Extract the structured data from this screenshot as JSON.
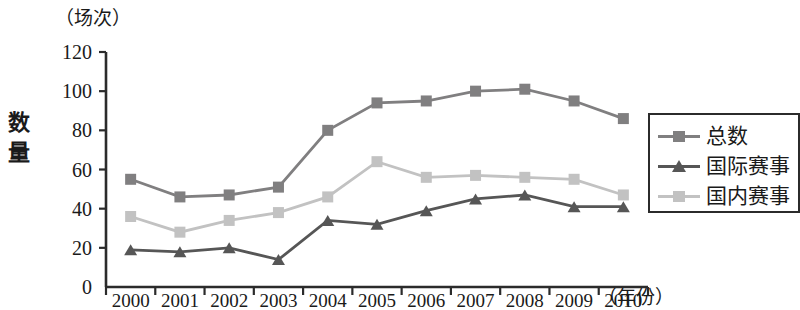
{
  "chart_data": {
    "type": "line",
    "title": "",
    "unit_label": "（场次）",
    "ylabel": "数量",
    "xlabel": "（年份）",
    "categories": [
      "2000",
      "2001",
      "2002",
      "2003",
      "2004",
      "2005",
      "2006",
      "2007",
      "2008",
      "2009",
      "2010"
    ],
    "ylim": [
      0,
      120
    ],
    "yticks": [
      0,
      20,
      40,
      60,
      80,
      100,
      120
    ],
    "ytick_labels": [
      "0",
      "20",
      "40",
      "60",
      "80",
      "100",
      "120"
    ],
    "grid": false,
    "legend_position": "right",
    "series": [
      {
        "name": "总数",
        "color": "#807f80",
        "marker": "square",
        "values": [
          55,
          46,
          47,
          51,
          80,
          94,
          95,
          100,
          101,
          95,
          86
        ]
      },
      {
        "name": "国际赛事",
        "color": "#565656",
        "marker": "triangle",
        "values": [
          19,
          18,
          20,
          14,
          34,
          32,
          39,
          45,
          47,
          41,
          41
        ]
      },
      {
        "name": "国内赛事",
        "color": "#c2c2c2",
        "marker": "square",
        "values": [
          36,
          28,
          34,
          38,
          46,
          64,
          56,
          57,
          56,
          55,
          47
        ]
      }
    ]
  },
  "axis": {
    "y_title_chars": [
      "数",
      "量"
    ],
    "unit": "（场次）",
    "x_unit": "（年份）"
  },
  "legend": {
    "items": [
      {
        "label": "总数"
      },
      {
        "label": "国际赛事"
      },
      {
        "label": "国内赛事"
      }
    ]
  }
}
